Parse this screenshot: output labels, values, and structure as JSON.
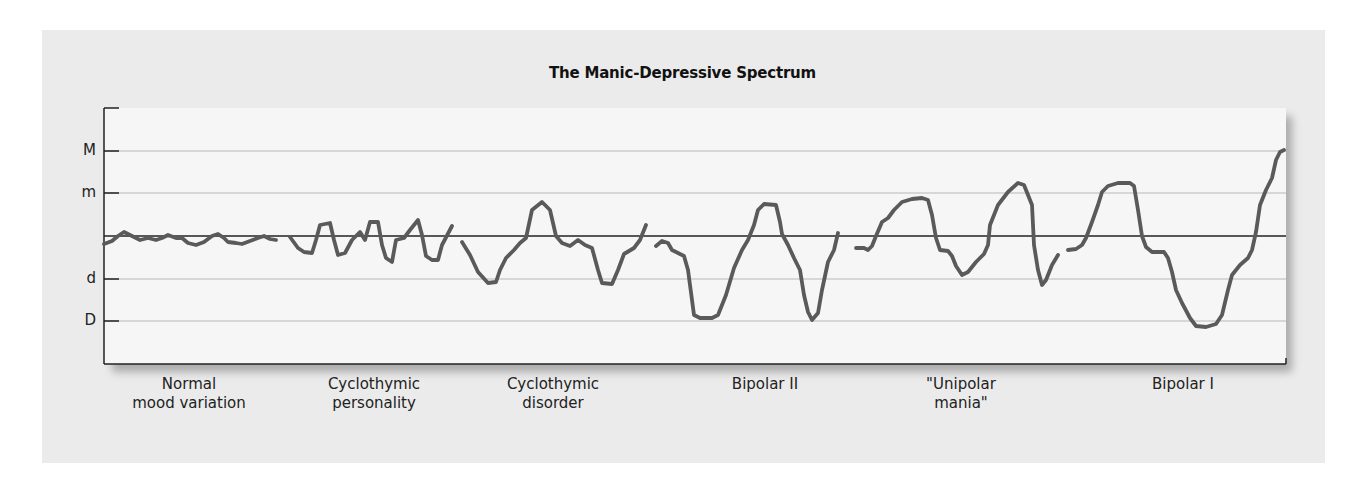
{
  "chart_data": {
    "type": "line",
    "title": "The Manic-Depressive Spectrum",
    "xlabel": "",
    "ylabel": "",
    "y_tick_labels": [
      "M",
      "m",
      "d",
      "D"
    ],
    "y_levels": {
      "M": 2,
      "m": 1,
      "baseline": 0,
      "d": -1,
      "D": -2
    },
    "ylim": [
      -2.7,
      3.0
    ],
    "grid": true,
    "legend": null,
    "categories": [
      "Normal\nmood variation",
      "Cyclothymic\npersonality",
      "Cyclothymic\ndisorder",
      "Bipolar II",
      "\"Unipolar\nmania\"",
      "Bipolar I"
    ],
    "series": [
      {
        "name": "Normal mood variation",
        "description": "small fluctuations around baseline, never reaching m or d",
        "approx_range": [
          -0.2,
          0.1
        ],
        "points": [
          [
            104,
            244
          ],
          [
            112,
            241
          ],
          [
            118,
            236
          ],
          [
            124,
            232
          ],
          [
            132,
            236
          ],
          [
            140,
            240
          ],
          [
            148,
            238
          ],
          [
            156,
            240
          ],
          [
            162,
            238
          ],
          [
            168,
            235
          ],
          [
            176,
            238
          ],
          [
            182,
            238
          ],
          [
            188,
            243
          ],
          [
            196,
            245
          ],
          [
            204,
            242
          ],
          [
            212,
            236
          ],
          [
            218,
            234
          ],
          [
            224,
            238
          ],
          [
            228,
            242
          ],
          [
            236,
            243
          ],
          [
            242,
            244
          ],
          [
            250,
            241
          ],
          [
            258,
            238
          ],
          [
            264,
            236
          ],
          [
            270,
            239
          ],
          [
            276,
            240
          ]
        ]
      },
      {
        "name": "Cyclothymic personality",
        "description": "frequent moderate swings, roughly ±0.6",
        "approx_range": [
          -0.6,
          0.4
        ],
        "points": [
          [
            290,
            237
          ],
          [
            298,
            248
          ],
          [
            304,
            252
          ],
          [
            312,
            253
          ],
          [
            316,
            240
          ],
          [
            320,
            225
          ],
          [
            330,
            223
          ],
          [
            334,
            240
          ],
          [
            338,
            255
          ],
          [
            345,
            253
          ],
          [
            352,
            240
          ],
          [
            360,
            232
          ],
          [
            365,
            240
          ],
          [
            370,
            222
          ],
          [
            378,
            222
          ],
          [
            382,
            245
          ],
          [
            386,
            258
          ],
          [
            392,
            262
          ],
          [
            396,
            240
          ],
          [
            404,
            238
          ],
          [
            410,
            230
          ],
          [
            418,
            220
          ],
          [
            422,
            235
          ],
          [
            426,
            256
          ],
          [
            432,
            260
          ],
          [
            438,
            260
          ],
          [
            442,
            245
          ],
          [
            452,
            226
          ]
        ]
      },
      {
        "name": "Cyclothymic disorder",
        "description": "swings between about +0.8 (near m) and -1.1 (just below d)",
        "approx_range": [
          -1.1,
          0.8
        ],
        "points": [
          [
            462,
            242
          ],
          [
            470,
            255
          ],
          [
            478,
            272
          ],
          [
            488,
            283
          ],
          [
            496,
            282
          ],
          [
            500,
            270
          ],
          [
            506,
            258
          ],
          [
            514,
            250
          ],
          [
            520,
            243
          ],
          [
            526,
            238
          ],
          [
            532,
            210
          ],
          [
            542,
            202
          ],
          [
            550,
            210
          ],
          [
            556,
            236
          ],
          [
            562,
            243
          ],
          [
            570,
            246
          ],
          [
            578,
            240
          ],
          [
            585,
            245
          ],
          [
            592,
            248
          ],
          [
            598,
            270
          ],
          [
            602,
            283
          ],
          [
            612,
            284
          ],
          [
            618,
            270
          ],
          [
            624,
            254
          ],
          [
            634,
            248
          ],
          [
            640,
            240
          ],
          [
            646,
            225
          ]
        ]
      },
      {
        "name": "Bipolar II",
        "description": "hypomanic peaks near +0.8 and deep depressions reaching D (-2)",
        "approx_range": [
          -2.0,
          0.8
        ],
        "points": [
          [
            656,
            246
          ],
          [
            662,
            241
          ],
          [
            668,
            243
          ],
          [
            672,
            250
          ],
          [
            678,
            253
          ],
          [
            684,
            256
          ],
          [
            688,
            270
          ],
          [
            692,
            300
          ],
          [
            694,
            315
          ],
          [
            700,
            318
          ],
          [
            712,
            318
          ],
          [
            718,
            315
          ],
          [
            726,
            295
          ],
          [
            734,
            268
          ],
          [
            742,
            250
          ],
          [
            748,
            240
          ],
          [
            754,
            225
          ],
          [
            758,
            210
          ],
          [
            764,
            204
          ],
          [
            776,
            205
          ],
          [
            780,
            222
          ],
          [
            782,
            234
          ],
          [
            788,
            245
          ],
          [
            794,
            258
          ],
          [
            800,
            270
          ],
          [
            804,
            295
          ],
          [
            808,
            312
          ],
          [
            812,
            320
          ],
          [
            818,
            313
          ],
          [
            822,
            290
          ],
          [
            828,
            262
          ],
          [
            834,
            250
          ],
          [
            838,
            233
          ]
        ]
      },
      {
        "name": "\"Unipolar mania\"",
        "description": "manic peaks near/above m (+1.2), mild dips to about -1.2",
        "approx_range": [
          -1.2,
          1.2
        ],
        "points": [
          [
            856,
            248
          ],
          [
            864,
            248
          ],
          [
            868,
            250
          ],
          [
            872,
            246
          ],
          [
            876,
            236
          ],
          [
            882,
            222
          ],
          [
            888,
            218
          ],
          [
            894,
            210
          ],
          [
            902,
            202
          ],
          [
            912,
            199
          ],
          [
            922,
            198
          ],
          [
            928,
            200
          ],
          [
            932,
            215
          ],
          [
            936,
            238
          ],
          [
            940,
            250
          ],
          [
            948,
            251
          ],
          [
            952,
            256
          ],
          [
            956,
            266
          ],
          [
            962,
            275
          ],
          [
            968,
            272
          ],
          [
            976,
            262
          ],
          [
            984,
            254
          ],
          [
            988,
            245
          ],
          [
            990,
            225
          ],
          [
            998,
            205
          ],
          [
            1008,
            192
          ],
          [
            1018,
            183
          ],
          [
            1024,
            185
          ],
          [
            1032,
            205
          ],
          [
            1034,
            245
          ],
          [
            1038,
            270
          ],
          [
            1042,
            285
          ],
          [
            1046,
            280
          ],
          [
            1052,
            265
          ],
          [
            1058,
            255
          ]
        ]
      },
      {
        "name": "Bipolar I",
        "description": "full mania reaching M (+2) and major depression below D (-2.1)",
        "approx_range": [
          -2.1,
          2.0
        ],
        "points": [
          [
            1068,
            250
          ],
          [
            1076,
            249
          ],
          [
            1082,
            245
          ],
          [
            1086,
            238
          ],
          [
            1092,
            222
          ],
          [
            1098,
            205
          ],
          [
            1102,
            192
          ],
          [
            1108,
            186
          ],
          [
            1118,
            183
          ],
          [
            1130,
            183
          ],
          [
            1134,
            186
          ],
          [
            1138,
            210
          ],
          [
            1142,
            236
          ],
          [
            1146,
            247
          ],
          [
            1152,
            252
          ],
          [
            1164,
            252
          ],
          [
            1168,
            258
          ],
          [
            1172,
            272
          ],
          [
            1176,
            290
          ],
          [
            1182,
            303
          ],
          [
            1190,
            318
          ],
          [
            1196,
            326
          ],
          [
            1206,
            327
          ],
          [
            1216,
            324
          ],
          [
            1222,
            315
          ],
          [
            1228,
            290
          ],
          [
            1232,
            275
          ],
          [
            1240,
            265
          ],
          [
            1248,
            258
          ],
          [
            1252,
            250
          ],
          [
            1256,
            232
          ],
          [
            1260,
            205
          ],
          [
            1266,
            190
          ],
          [
            1272,
            178
          ],
          [
            1276,
            160
          ],
          [
            1280,
            152
          ],
          [
            1284,
            150
          ]
        ]
      }
    ],
    "layout": {
      "plot_box": {
        "x": 104,
        "y": 108,
        "w": 1182,
        "h": 256
      },
      "grid_y": {
        "M": 151,
        "m": 193,
        "baseline": 236,
        "d": 279,
        "D": 321
      },
      "top_tick_y": 108,
      "label_centers_x": [
        189,
        374,
        553,
        765,
        961,
        1183
      ]
    }
  },
  "colors": {
    "panel_bg": "#ebebeb",
    "plot_bg": "#f6f6f6",
    "curve": "#5a5a5a",
    "baseline": "#222222",
    "grid": "#b8b8b8",
    "axis": "#222222",
    "text": "#111111"
  }
}
